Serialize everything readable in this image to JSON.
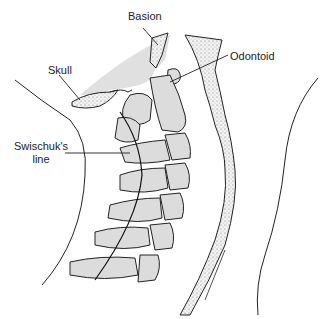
{
  "figure": {
    "labels": {
      "basion": "Basion",
      "skull": "Skull",
      "odontoid": "Odontoid",
      "swischuk_line_1": "Swischuk's",
      "swischuk_line_2": "line"
    },
    "colors": {
      "bone_fill": "#dcdcdc",
      "skull_fill": "#e0e0e0",
      "outline": "#222222",
      "background": "#ffffff"
    }
  }
}
